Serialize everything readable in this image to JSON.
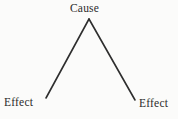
{
  "diagram": {
    "type": "cause-and-effect-branching-diagram",
    "background_color": "#fbfbfa",
    "line_color": "#2e2e2e",
    "text_color": "#2b2b2b",
    "nodes": {
      "cause": {
        "label": "Cause",
        "position": "top-center"
      },
      "effect_left": {
        "label": "Effect",
        "position": "bottom-left"
      },
      "effect_right": {
        "label": "Effect",
        "position": "bottom-right"
      }
    },
    "edges": [
      {
        "name": "cause-to-effect-left",
        "from": "cause",
        "to": "effect_left",
        "x1": 89,
        "y1": 19,
        "x2": 46,
        "y2": 98
      },
      {
        "name": "cause-to-effect-right",
        "from": "cause",
        "to": "effect_right",
        "x1": 89,
        "y1": 19,
        "x2": 135,
        "y2": 100
      }
    ]
  }
}
